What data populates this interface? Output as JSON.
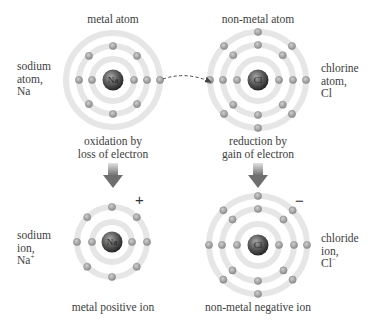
{
  "colors": {
    "ring": "#e6e6e6",
    "electron_fill": "#a8a8a8",
    "electron_stroke": "#8f8f8f",
    "nucleus_light": "#9a9a9a",
    "nucleus_dark": "#2e2e2e",
    "arrow_light": "#d9d9d9",
    "arrow_dark": "#707070",
    "text": "#3d3d3d"
  },
  "atoms": {
    "sodium_atom": {
      "heading": "metal atom",
      "side_label": [
        "sodium",
        "atom,",
        "Na"
      ],
      "symbol": "Na",
      "center": [
        113,
        80
      ],
      "ring_radii": [
        21,
        34,
        47
      ],
      "electrons_per_ring": [
        2,
        8,
        1
      ],
      "caption": [
        "oxidation by",
        "loss of electron"
      ]
    },
    "chlorine_atom": {
      "heading": "non-metal atom",
      "side_label": [
        "chlorine",
        "atom,",
        "Cl"
      ],
      "symbol": "Cl",
      "center": [
        258,
        80
      ],
      "ring_radii": [
        21,
        35,
        48
      ],
      "electrons_per_ring": [
        2,
        8,
        7
      ],
      "caption": [
        "reduction by",
        "gain of electron"
      ]
    },
    "sodium_ion": {
      "side_label": [
        "sodium",
        "ion,"
      ],
      "formula": "Na",
      "formula_charge": "+",
      "symbol": "Na",
      "center": [
        112,
        242
      ],
      "ring_radii": [
        20,
        35
      ],
      "electrons_per_ring": [
        2,
        8
      ],
      "charge": "+",
      "caption": "metal positive ion"
    },
    "chloride_ion": {
      "side_label": [
        "chloride",
        "ion,"
      ],
      "formula": "Cl",
      "formula_charge": "−",
      "symbol": "Cl",
      "center": [
        258,
        245
      ],
      "ring_radii": [
        21,
        36,
        49
      ],
      "electrons_per_ring": [
        2,
        8,
        8
      ],
      "charge": "−",
      "caption": "non-metal negative ion"
    }
  },
  "transfer_arrow": {
    "style": "dashed",
    "from": [
      162,
      79
    ],
    "to": [
      212,
      82
    ]
  }
}
